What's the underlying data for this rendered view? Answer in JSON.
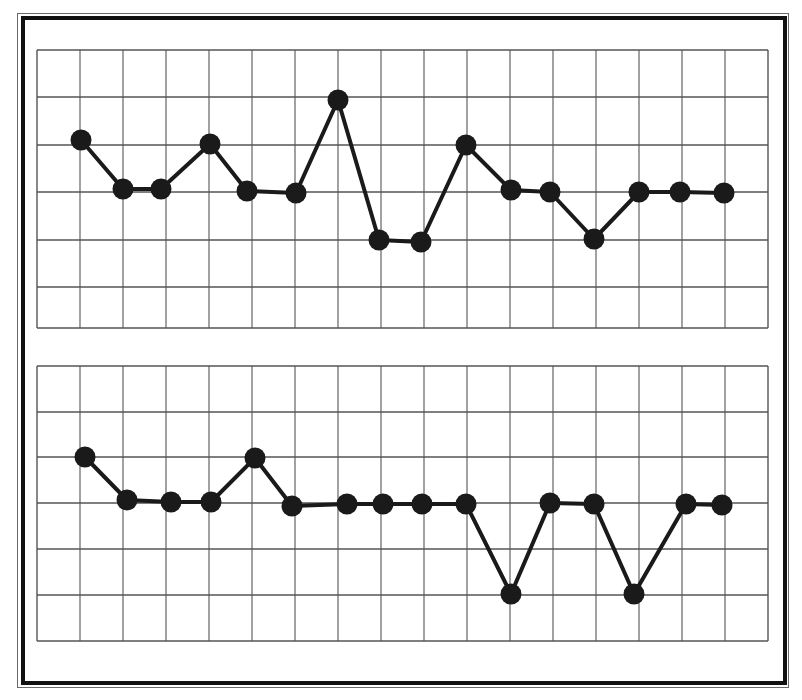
{
  "figure": {
    "background": "#ffffff",
    "frame_color": "#111111",
    "grid_color": "#555555",
    "line_color": "#1a1a1a",
    "marker_color": "#1a1a1a"
  },
  "chart_data": [
    {
      "type": "line",
      "title": "",
      "xlabel": "",
      "ylabel": "",
      "grid": true,
      "grid_columns": 17,
      "grid_rows": 6,
      "ylim": [
        0,
        6
      ],
      "xlim": [
        0,
        17
      ],
      "x": [
        1,
        2,
        3,
        4,
        5,
        6,
        7,
        8,
        9,
        10,
        11,
        12,
        13,
        14,
        15,
        16
      ],
      "values": [
        4.1,
        3.0,
        3.0,
        4.0,
        3.0,
        3.0,
        5.0,
        2.0,
        2.0,
        4.0,
        3.0,
        3.0,
        2.0,
        3.0,
        3.0,
        3.0
      ],
      "legend": [],
      "tick_labels": []
    },
    {
      "type": "line",
      "title": "",
      "xlabel": "",
      "ylabel": "",
      "grid": true,
      "grid_columns": 17,
      "grid_rows": 6,
      "ylim": [
        0,
        6
      ],
      "xlim": [
        0,
        17
      ],
      "x": [
        1,
        2,
        3,
        4,
        5,
        6,
        7,
        8,
        9,
        10,
        11,
        12,
        13,
        14,
        15,
        16
      ],
      "values": [
        4.0,
        3.0,
        3.0,
        3.0,
        4.0,
        3.0,
        3.0,
        3.0,
        3.0,
        3.0,
        1.0,
        3.0,
        3.0,
        1.0,
        3.0,
        3.0
      ],
      "legend": [],
      "tick_labels": []
    }
  ],
  "panels": [
    {
      "px_x": [
        81,
        123,
        161,
        210,
        247,
        296,
        338,
        379,
        421,
        466,
        511,
        550,
        594,
        639,
        680,
        724
      ],
      "px_y": [
        140,
        189,
        189,
        144,
        191,
        193,
        100,
        240,
        242,
        145,
        190,
        192,
        239,
        192,
        192,
        193
      ],
      "grid_left": 37,
      "grid_right": 768,
      "grid_top": 50,
      "grid_bottom": 328,
      "v_lines": [
        37,
        80,
        123,
        166,
        209,
        252,
        295,
        338,
        381,
        424,
        467,
        510,
        553,
        596,
        639,
        682,
        725,
        768
      ],
      "h_lines": [
        50,
        97,
        145,
        192,
        240,
        287,
        328
      ]
    },
    {
      "px_x": [
        85,
        127,
        171,
        211,
        255,
        292,
        347,
        383,
        422,
        466,
        511,
        550,
        594,
        634,
        686,
        722
      ],
      "px_y": [
        457,
        500,
        502,
        502,
        458,
        506,
        504,
        504,
        504,
        504,
        594,
        503,
        504,
        594,
        504,
        505
      ],
      "grid_left": 37,
      "grid_right": 768,
      "grid_top": 366,
      "grid_bottom": 641,
      "v_lines": [
        37,
        80,
        123,
        166,
        209,
        252,
        295,
        338,
        381,
        424,
        467,
        510,
        553,
        596,
        639,
        682,
        725,
        768
      ],
      "h_lines": [
        366,
        412,
        457,
        503,
        549,
        595,
        641
      ]
    }
  ]
}
